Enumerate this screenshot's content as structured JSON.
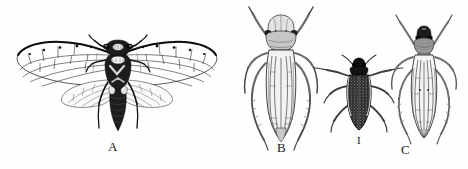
{
  "plate": {
    "title": "Insect illustration plate",
    "background_color": "#fefefe",
    "ink_color": "#111111",
    "width": 468,
    "height": 169,
    "style": "black and white engraved line drawing, entomological figure plate"
  },
  "figures": [
    {
      "id": "A",
      "label": "A",
      "common_name": "cicada",
      "view": "dorsal, wings spread",
      "label_x": 112,
      "label_y": 147
    },
    {
      "id": "B",
      "label": "B",
      "common_name": "leafhopper",
      "view": "dorsal, wings folded",
      "label_x": 281,
      "label_y": 148
    },
    {
      "id": "I",
      "label": "I",
      "common_name": "small dark beetle-like insect",
      "view": "dorsal",
      "label_x": 359,
      "label_y": 143
    },
    {
      "id": "C",
      "label": "C",
      "common_name": "planthopper",
      "view": "dorsal, wings folded",
      "label_x": 404,
      "label_y": 150
    }
  ]
}
